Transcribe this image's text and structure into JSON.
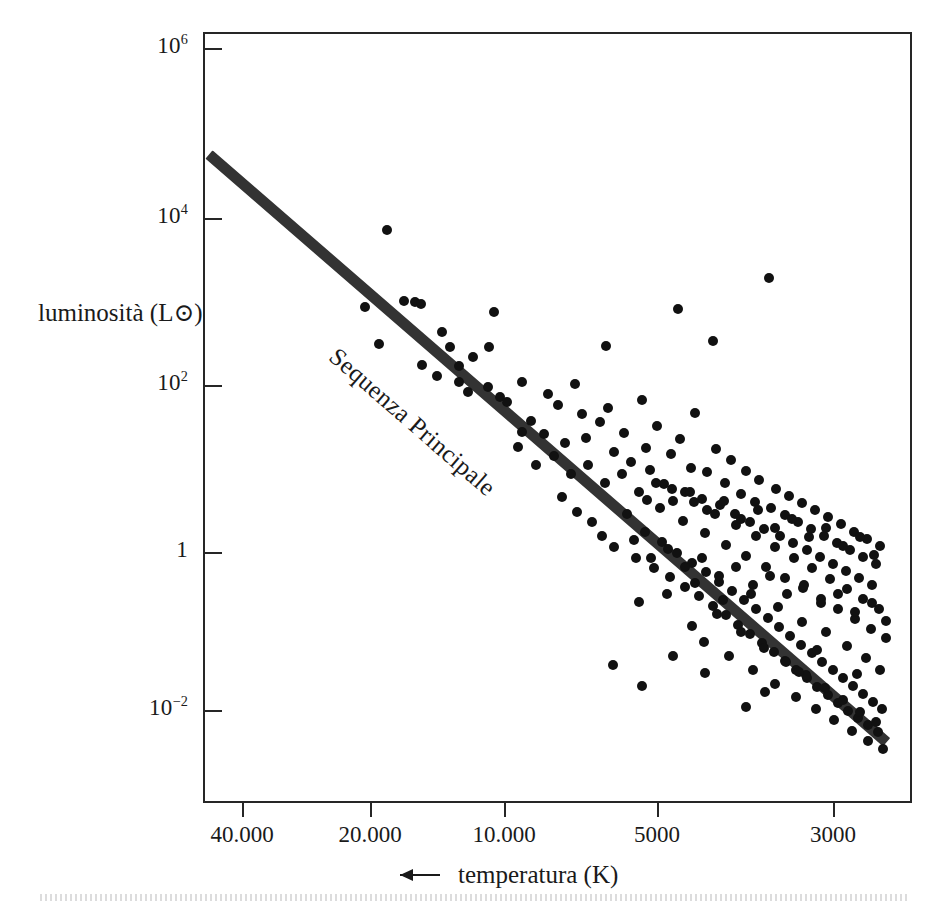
{
  "figure": {
    "kind": "scientific-figure",
    "caption_language": "it"
  },
  "chart_data": {
    "type": "scatter",
    "title": "",
    "subtitle": "",
    "xlabel": "temperatura (K)",
    "ylabel": "luminosità (L⊙)",
    "xlabel_prefix_icon": "left-arrow-icon",
    "x_scale": "log",
    "y_scale": "log",
    "x_reversed": true,
    "grid": false,
    "legend": null,
    "xlim": [
      47000,
      2550
    ],
    "ylim": [
      0.0025,
      2500000
    ],
    "xticks": [
      40000,
      20000,
      10000,
      5000,
      3000
    ],
    "xticklabels": [
      "40.000",
      "20.000",
      "10.000",
      "5000",
      "3000"
    ],
    "xtick_px": [
      242,
      370,
      504,
      657,
      833
    ],
    "yticks": [
      1000000,
      10000,
      100,
      1,
      0.01
    ],
    "yticklabels": [
      "10^6",
      "10^4",
      "10^2",
      "1",
      "10^-2"
    ],
    "yticklabel_parts": [
      {
        "base": "10",
        "exp": "6"
      },
      {
        "base": "10",
        "exp": "4"
      },
      {
        "base": "10",
        "exp": "2"
      },
      {
        "base": "1",
        "exp": ""
      },
      {
        "base": "10",
        "exp": "-2"
      }
    ],
    "ytick_px": [
      48,
      218,
      385,
      552,
      710
    ],
    "annotations": [
      {
        "text": "Sequenza Principale",
        "rotation_deg": 41,
        "x_px": 331,
        "y_px": 338,
        "name": "main-sequence-annotation"
      }
    ],
    "series": [
      {
        "name": "Sequenza Principale",
        "type": "line",
        "style": "thick-solid-band",
        "color": "#2b2b2b",
        "linewidth_px": 11,
        "endpoints_px": [
          [
            207,
            152
          ],
          [
            885,
            740
          ]
        ],
        "endpoints_data": [
          [
            46000,
            52000
          ],
          [
            2600,
            0.0048
          ]
        ]
      },
      {
        "name": "stelle",
        "type": "scatter",
        "marker": "filled-circle",
        "marker_size_px": 10,
        "color": "#111111",
        "count": 231,
        "points_px": [
          [
            385,
            228
          ],
          [
            402,
            299
          ],
          [
            413,
            300
          ],
          [
            419,
            302
          ],
          [
            363,
            305
          ],
          [
            440,
            330
          ],
          [
            377,
            342
          ],
          [
            448,
            345
          ],
          [
            471,
            355
          ],
          [
            492,
            310
          ],
          [
            487,
            345
          ],
          [
            457,
            364
          ],
          [
            420,
            363
          ],
          [
            435,
            374
          ],
          [
            457,
            380
          ],
          [
            486,
            385
          ],
          [
            466,
            390
          ],
          [
            498,
            395
          ],
          [
            505,
            400
          ],
          [
            520,
            380
          ],
          [
            529,
            419
          ],
          [
            546,
            392
          ],
          [
            556,
            403
          ],
          [
            573,
            382
          ],
          [
            580,
            412
          ],
          [
            520,
            430
          ],
          [
            542,
            432
          ],
          [
            563,
            441
          ],
          [
            584,
            436
          ],
          [
            598,
            420
          ],
          [
            604,
            344
          ],
          [
            606,
            406
          ],
          [
            612,
            450
          ],
          [
            622,
            431
          ],
          [
            629,
            460
          ],
          [
            640,
            398
          ],
          [
            644,
            446
          ],
          [
            648,
            468
          ],
          [
            655,
            424
          ],
          [
            662,
            482
          ],
          [
            669,
            452
          ],
          [
            676,
            307
          ],
          [
            678,
            437
          ],
          [
            683,
            490
          ],
          [
            689,
            466
          ],
          [
            693,
            411
          ],
          [
            700,
            497
          ],
          [
            705,
            470
          ],
          [
            711,
            339
          ],
          [
            714,
            447
          ],
          [
            718,
            503
          ],
          [
            723,
            481
          ],
          [
            729,
            458
          ],
          [
            733,
            512
          ],
          [
            739,
            492
          ],
          [
            744,
            469
          ],
          [
            748,
            520
          ],
          [
            753,
            500
          ],
          [
            757,
            478
          ],
          [
            762,
            527
          ],
          [
            767,
            276
          ],
          [
            769,
            506
          ],
          [
            774,
            487
          ],
          [
            778,
            534
          ],
          [
            783,
            513
          ],
          [
            787,
            494
          ],
          [
            791,
            541
          ],
          [
            796,
            520
          ],
          [
            800,
            501
          ],
          [
            805,
            548
          ],
          [
            809,
            527
          ],
          [
            813,
            508
          ],
          [
            818,
            555
          ],
          [
            822,
            534
          ],
          [
            826,
            515
          ],
          [
            831,
            562
          ],
          [
            835,
            541
          ],
          [
            839,
            522
          ],
          [
            844,
            569
          ],
          [
            848,
            548
          ],
          [
            852,
            530
          ],
          [
            857,
            576
          ],
          [
            861,
            555
          ],
          [
            865,
            537
          ],
          [
            870,
            583
          ],
          [
            874,
            562
          ],
          [
            878,
            544
          ],
          [
            560,
            495
          ],
          [
            575,
            510
          ],
          [
            590,
            520
          ],
          [
            600,
            534
          ],
          [
            612,
            545
          ],
          [
            625,
            512
          ],
          [
            634,
            556
          ],
          [
            643,
            530
          ],
          [
            652,
            566
          ],
          [
            660,
            540
          ],
          [
            668,
            575
          ],
          [
            675,
            551
          ],
          [
            683,
            585
          ],
          [
            690,
            561
          ],
          [
            697,
            594
          ],
          [
            704,
            570
          ],
          [
            711,
            604
          ],
          [
            717,
            580
          ],
          [
            724,
            613
          ],
          [
            730,
            589
          ],
          [
            736,
            623
          ],
          [
            742,
            598
          ],
          [
            748,
            632
          ],
          [
            754,
            607
          ],
          [
            760,
            641
          ],
          [
            766,
            616
          ],
          [
            772,
            650
          ],
          [
            777,
            625
          ],
          [
            783,
            659
          ],
          [
            788,
            634
          ],
          [
            794,
            668
          ],
          [
            799,
            643
          ],
          [
            805,
            676
          ],
          [
            810,
            651
          ],
          [
            815,
            685
          ],
          [
            820,
            660
          ],
          [
            826,
            693
          ],
          [
            831,
            668
          ],
          [
            836,
            701
          ],
          [
            841,
            676
          ],
          [
            846,
            709
          ],
          [
            851,
            684
          ],
          [
            856,
            716
          ],
          [
            861,
            692
          ],
          [
            866,
            723
          ],
          [
            871,
            700
          ],
          [
            876,
            730
          ],
          [
            880,
            707
          ],
          [
            645,
            498
          ],
          [
            658,
            506
          ],
          [
            670,
            487
          ],
          [
            681,
            519
          ],
          [
            692,
            500
          ],
          [
            703,
            531
          ],
          [
            713,
            512
          ],
          [
            724,
            543
          ],
          [
            734,
            523
          ],
          [
            744,
            554
          ],
          [
            754,
            534
          ],
          [
            764,
            565
          ],
          [
            773,
            545
          ],
          [
            783,
            576
          ],
          [
            792,
            556
          ],
          [
            801,
            586
          ],
          [
            810,
            566
          ],
          [
            819,
            597
          ],
          [
            828,
            577
          ],
          [
            836,
            607
          ],
          [
            845,
            587
          ],
          [
            853,
            617
          ],
          [
            861,
            597
          ],
          [
            869,
            627
          ],
          [
            877,
            607
          ],
          [
            884,
            636
          ],
          [
            690,
            624
          ],
          [
            702,
            640
          ],
          [
            715,
            612
          ],
          [
            727,
            654
          ],
          [
            739,
            630
          ],
          [
            751,
            668
          ],
          [
            762,
            646
          ],
          [
            773,
            682
          ],
          [
            784,
            660
          ],
          [
            794,
            695
          ],
          [
            804,
            673
          ],
          [
            814,
            707
          ],
          [
            823,
            686
          ],
          [
            832,
            718
          ],
          [
            841,
            698
          ],
          [
            850,
            729
          ],
          [
            858,
            710
          ],
          [
            866,
            739
          ],
          [
            874,
            720
          ],
          [
            881,
            747
          ],
          [
            637,
            600
          ],
          [
            665,
            592
          ],
          [
            693,
            581
          ],
          [
            721,
            598
          ],
          [
            749,
            592
          ],
          [
            776,
            605
          ],
          [
            800,
            620
          ],
          [
            824,
            630
          ],
          [
            845,
            644
          ],
          [
            864,
            656
          ],
          [
            878,
            668
          ],
          [
            516,
            445
          ],
          [
            534,
            463
          ],
          [
            552,
            454
          ],
          [
            569,
            472
          ],
          [
            586,
            463
          ],
          [
            603,
            481
          ],
          [
            620,
            472
          ],
          [
            637,
            490
          ],
          [
            654,
            481
          ],
          [
            671,
            499
          ],
          [
            688,
            490
          ],
          [
            705,
            508
          ],
          [
            722,
            499
          ],
          [
            739,
            517
          ],
          [
            756,
            508
          ],
          [
            773,
            526
          ],
          [
            790,
            517
          ],
          [
            807,
            535
          ],
          [
            824,
            526
          ],
          [
            841,
            544
          ],
          [
            858,
            535
          ],
          [
            872,
            553
          ],
          [
            632,
            538
          ],
          [
            649,
            556
          ],
          [
            666,
            547
          ],
          [
            683,
            565
          ],
          [
            700,
            556
          ],
          [
            717,
            574
          ],
          [
            734,
            565
          ],
          [
            751,
            583
          ],
          [
            768,
            574
          ],
          [
            785,
            592
          ],
          [
            802,
            583
          ],
          [
            819,
            601
          ],
          [
            836,
            592
          ],
          [
            853,
            610
          ],
          [
            870,
            601
          ],
          [
            884,
            619
          ],
          [
            797,
            670
          ],
          [
            815,
            648
          ],
          [
            763,
            690
          ],
          [
            744,
            705
          ],
          [
            703,
            671
          ],
          [
            671,
            654
          ],
          [
            640,
            684
          ],
          [
            611,
            663
          ],
          [
            855,
            672
          ]
        ]
      }
    ]
  }
}
